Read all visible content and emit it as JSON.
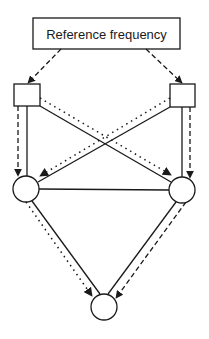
{
  "diagram": {
    "title_box": {
      "label": "Reference frequency",
      "x": 33,
      "y": 18,
      "w": 147,
      "h": 31
    },
    "colors": {
      "stroke": "#1a1a1a",
      "background": "#ffffff"
    },
    "nodes": [
      {
        "id": "box-left",
        "shape": "rect",
        "x": 14,
        "y": 84,
        "w": 26,
        "h": 22
      },
      {
        "id": "box-right",
        "shape": "rect",
        "x": 170,
        "y": 84,
        "w": 25,
        "h": 23
      },
      {
        "id": "circle-left",
        "shape": "circle",
        "cx": 26,
        "cy": 189,
        "r": 13
      },
      {
        "id": "circle-right",
        "shape": "circle",
        "cx": 182,
        "cy": 190,
        "r": 13
      },
      {
        "id": "circle-bottom",
        "shape": "circle",
        "cx": 104,
        "cy": 307,
        "r": 13
      }
    ],
    "legend_styles": [
      "solid",
      "dashed",
      "dotted"
    ]
  }
}
